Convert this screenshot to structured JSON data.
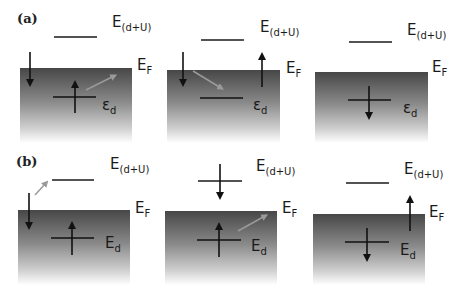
{
  "figure": {
    "panel_labels": [
      "(a)",
      "(b)"
    ],
    "colors": {
      "band_top": "#4a4a4a",
      "band_bottom": "#ffffff",
      "line": "#1a1a1a",
      "hop_arrow": "#9a9a9a"
    },
    "rows": [
      {
        "label": "(a)",
        "level_symbol": "ε",
        "panels": [
          {
            "upper_label": "E",
            "upper_sub": "(d+U)",
            "fermi_label": "E",
            "fermi_sub": "F",
            "lower_label": "ε",
            "lower_sub": "d",
            "lower_level_spin": "up",
            "upper_level_spin": "none",
            "band_spin": "down",
            "hop": "lower-to-band"
          },
          {
            "upper_label": "E",
            "upper_sub": "(d+U)",
            "fermi_label": "E",
            "fermi_sub": "F",
            "lower_label": "ε",
            "lower_sub": "d",
            "lower_level_spin": "none",
            "upper_level_spin": "none",
            "band_spin": "down",
            "escaping_spin": "up",
            "hop": "band-to-lower"
          },
          {
            "upper_label": "E",
            "upper_sub": "(d+U)",
            "fermi_label": "E",
            "fermi_sub": "F",
            "lower_label": "ε",
            "lower_sub": "d",
            "lower_level_spin": "down",
            "upper_level_spin": "none",
            "hop": "none"
          }
        ]
      },
      {
        "label": "(b)",
        "level_symbol": "E",
        "panels": [
          {
            "upper_label": "E",
            "upper_sub": "(d+U)",
            "fermi_label": "E",
            "fermi_sub": "F",
            "lower_label": "E",
            "lower_sub": "d",
            "lower_level_spin": "up",
            "upper_level_spin": "none",
            "band_spin": "down",
            "hop": "band-to-upper"
          },
          {
            "upper_label": "E",
            "upper_sub": "(d+U)",
            "fermi_label": "E",
            "fermi_sub": "F",
            "lower_label": "E",
            "lower_sub": "d",
            "lower_level_spin": "up",
            "upper_level_spin": "down",
            "hop": "lower-to-band"
          },
          {
            "upper_label": "E",
            "upper_sub": "(d+U)",
            "fermi_label": "E",
            "fermi_sub": "F",
            "lower_label": "E",
            "lower_sub": "d",
            "lower_level_spin": "down",
            "upper_level_spin": "none",
            "escaping_spin": "up",
            "hop": "none"
          }
        ]
      }
    ]
  }
}
